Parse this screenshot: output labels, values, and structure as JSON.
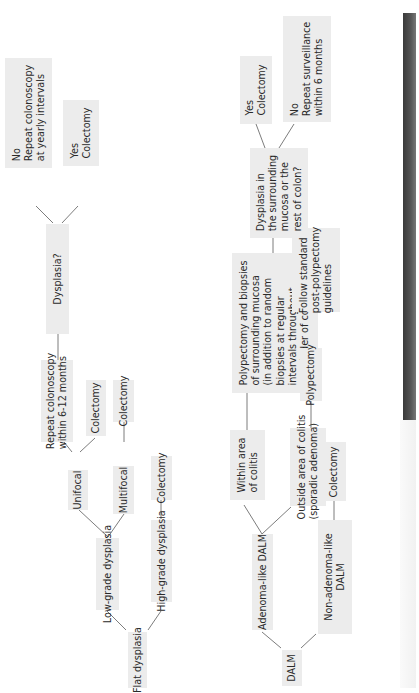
{
  "diagram": {
    "orientation": "rotated-90-ccw",
    "colors": {
      "box_fill": "#ececec",
      "line": "#6d6d6d",
      "text": "#2a2a2a",
      "side_bar": "#4a4a4a"
    },
    "flat_dysplasia_tree": {
      "root": "Flat dysplasia",
      "low_grade": "Low-grade dysplasia",
      "high_grade": "High-grade dysplasia",
      "high_grade_action": "Colectomy",
      "unifocal": "Unifocal",
      "multifocal": "Multifocal",
      "multifocal_action": "Colectomy",
      "unifocal_colectomy": "Colectomy",
      "unifocal_repeat": "Repeat colonoscopy\nwithin 6-12 months",
      "dysplasia_question": "Dysplasia?",
      "answer_no": "No\nRepeat colonoscopy\nat yearly intervals",
      "answer_yes": "Yes\nColectomy"
    },
    "dalm_tree": {
      "root": "DALM",
      "adenoma_like": "Adenoma-like DALM",
      "non_adenoma_like": "Non-adenoma-like\nDALM",
      "non_adenoma_action": "Colectomy",
      "within_colitis": "Within area\nof colitis",
      "outside_colitis": "Outside area of colitis\n(sporadic adenoma)",
      "within_action": "Polypectomy and biopsies\nof surrounding mucosa\n(in addition to random\nbiopsies at regular\nintervals throughout\nremainder of colon)",
      "outside_action": "Polypectomy",
      "outside_followup": "Follow standard\npost-polypectomy\nguidelines",
      "dysplasia_question": "Dysplasia in\nthe surrounding\nmucosa or the\nrest of colon?",
      "answer_yes": "Yes\nColectomy",
      "answer_no": "No\nRepeat surveillance\nwithin 6 months"
    }
  }
}
